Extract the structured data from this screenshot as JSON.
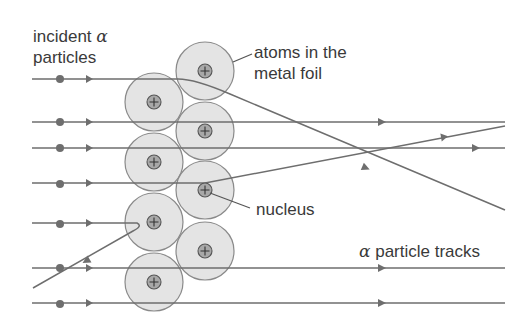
{
  "labels": {
    "incident_line1": "incident",
    "incident_alpha": "α",
    "incident_line2": "particles",
    "atoms_line1": "atoms in the",
    "atoms_line2": "metal foil",
    "nucleus": "nucleus",
    "tracks_alpha": "α",
    "tracks_text": " particle tracks"
  },
  "nucleus_symbol": "+",
  "colors": {
    "track": "#6e6e6e",
    "atom_fill": "#e4e4e4",
    "atom_stroke": "#8a8a8a",
    "nucleus_fill": "#a8a8a8",
    "nucleus_stroke": "#555555",
    "text": "#3a3a3a"
  },
  "atoms": [
    {
      "cx": 154,
      "cy": 102,
      "r": 29
    },
    {
      "cx": 154,
      "cy": 162,
      "r": 29
    },
    {
      "cx": 154,
      "cy": 222,
      "r": 29
    },
    {
      "cx": 154,
      "cy": 282,
      "r": 29
    },
    {
      "cx": 205,
      "cy": 71,
      "r": 29
    },
    {
      "cx": 205,
      "cy": 131,
      "r": 29
    },
    {
      "cx": 205,
      "cy": 190,
      "r": 29
    },
    {
      "cx": 205,
      "cy": 251,
      "r": 29
    }
  ],
  "tracks": [
    {
      "id": "deflected-down",
      "y": 79,
      "path": "M32 79 L178 79 Q195 79 230 94 L505 210"
    },
    {
      "id": "straight-1",
      "y": 122,
      "path": "M32 122 L505 122"
    },
    {
      "id": "straight-2",
      "y": 148,
      "path": "M32 148 L505 148"
    },
    {
      "id": "deflected-up",
      "y": 183,
      "path": "M32 183 L205 183 L505 126"
    },
    {
      "id": "backscattered",
      "y": 223,
      "path": "M32 223 L137 223 Q142 226 132 230 L33 288"
    },
    {
      "id": "straight-3",
      "y": 268,
      "path": "M32 268 L505 268"
    },
    {
      "id": "straight-4",
      "y": 303,
      "path": "M32 303 L505 303"
    }
  ]
}
